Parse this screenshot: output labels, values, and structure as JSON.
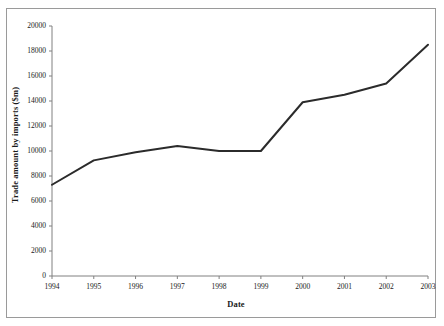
{
  "chart_data": {
    "type": "line",
    "title": "",
    "xlabel": "Date",
    "ylabel": "Trade amount by imports ($m)",
    "categories": [
      "1994",
      "1995",
      "1996",
      "1997",
      "1998",
      "1999",
      "2000",
      "2001",
      "2002",
      "2003"
    ],
    "x": [
      1994,
      1995,
      1996,
      1997,
      1998,
      1999,
      2000,
      2001,
      2002,
      2003
    ],
    "values": [
      7300,
      9250,
      9900,
      10400,
      10000,
      10000,
      13900,
      14500,
      15400,
      18500
    ],
    "series": [
      {
        "name": "Trade amount by imports",
        "values": [
          7300,
          9250,
          9900,
          10400,
          10000,
          10000,
          13900,
          14500,
          15400,
          18500
        ]
      }
    ],
    "ylim": [
      0,
      20000
    ],
    "xlim": [
      1994,
      2003
    ],
    "y_ticks": [
      0,
      2000,
      4000,
      6000,
      8000,
      10000,
      12000,
      14000,
      16000,
      18000,
      20000
    ],
    "y_tick_labels": [
      "0",
      "2000",
      "4000",
      "6000",
      "8000",
      "10000",
      "12000",
      "14000",
      "16000",
      "18000",
      "20000"
    ],
    "x_ticks": [
      1994,
      1995,
      1996,
      1997,
      1998,
      1999,
      2000,
      2001,
      2002,
      2003
    ],
    "x_tick_labels": [
      "1994",
      "1995",
      "1996",
      "1997",
      "1998",
      "1999",
      "2000",
      "2001",
      "2002",
      "2003"
    ],
    "grid": false,
    "legend": false,
    "line_color": "#2b2b2b",
    "line_width": 2,
    "axis_color": "#808080",
    "background_color": "#ffffff",
    "frame_border_color": "#9a9a9a"
  }
}
